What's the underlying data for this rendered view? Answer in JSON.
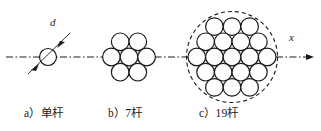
{
  "figure": {
    "type": "engineering-diagram",
    "width": 321,
    "height": 131,
    "background_color": "#ffffff",
    "stroke_color": "#1a1a1a",
    "centerline": {
      "style": "dash-dot",
      "y": 57,
      "x_start": 6,
      "x_end": 316
    },
    "axis_arrow": {
      "label": "x",
      "direction": "right",
      "x_tip": 314,
      "y": 57
    },
    "diameter_callout": {
      "label": "d",
      "target_group": "a"
    },
    "groups": [
      {
        "id": "a",
        "caption": "a）单杆",
        "rod_count": 1,
        "center_x": 48,
        "center_y": 57,
        "rod_radius": 8.5,
        "enclosing_circle": false,
        "rows": [
          1
        ]
      },
      {
        "id": "b",
        "caption": "b）7杆",
        "rod_count": 7,
        "center_x": 129,
        "center_y": 57,
        "rod_radius": 8.8,
        "enclosing_circle": false,
        "rows": [
          2,
          3,
          2
        ]
      },
      {
        "id": "c",
        "caption": "c）19杆",
        "rod_count": 19,
        "center_x": 232,
        "center_y": 57,
        "rod_radius": 8.8,
        "enclosing_circle": true,
        "enclosing_circle_style": "dashed",
        "enclosing_circle_radius": 46,
        "rows": [
          3,
          4,
          5,
          4,
          3
        ]
      }
    ]
  },
  "captions": {
    "a": "a）单杆",
    "b": "b）7杆",
    "c": "c）19杆"
  },
  "labels": {
    "diameter": "d",
    "axis": "x"
  },
  "colors": {
    "stroke": "#1a1a1a",
    "background": "#ffffff",
    "text": "#1a1a1a"
  }
}
